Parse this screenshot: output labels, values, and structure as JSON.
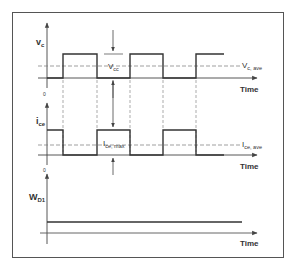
{
  "diagram": {
    "frame": {
      "x": 12,
      "y": 12,
      "w": 272,
      "h": 246,
      "color": "#555555"
    },
    "colors": {
      "trace": "#333333",
      "axis": "#555555",
      "dashed": "#777777",
      "text": "#333333"
    },
    "plots": [
      {
        "id": "vc",
        "ylabel_main": "v",
        "ylabel_sub": "c",
        "time_label": "Time",
        "zero_label": "0",
        "avg_label_main": "V",
        "avg_label_sub": "c, ave",
        "amp_label_main": "V",
        "amp_label_sub": "cc"
      },
      {
        "id": "ice",
        "ylabel_main": "i",
        "ylabel_sub": "ce",
        "time_label": "Time",
        "zero_label": "0",
        "avg_label_main": "I",
        "avg_label_sub": "ce, ave",
        "amp_label_main": "I",
        "amp_label_sub": "ce, max"
      },
      {
        "id": "wd1",
        "ylabel_main": "W",
        "ylabel_sub": "D1",
        "time_label": "Time"
      }
    ]
  }
}
